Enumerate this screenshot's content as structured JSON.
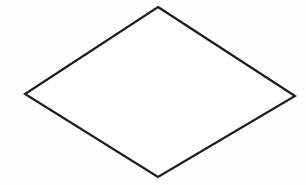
{
  "figure": {
    "name": "rhombus",
    "shape_type": "polygon",
    "sides": 4,
    "background_color": "#fefefe",
    "stroke_color": "#1c1c1c",
    "fill_color": "#ffffff",
    "stroke_width": 2.2,
    "canvas": {
      "width": 306,
      "height": 185
    },
    "vertices": [
      {
        "label": "top",
        "x": 158,
        "y": 7
      },
      {
        "label": "right",
        "x": 295,
        "y": 96
      },
      {
        "label": "bottom",
        "x": 158,
        "y": 177
      },
      {
        "label": "left",
        "x": 25,
        "y": 94
      }
    ],
    "points_attribute": "158,7 295,96 158,177 25,94"
  }
}
